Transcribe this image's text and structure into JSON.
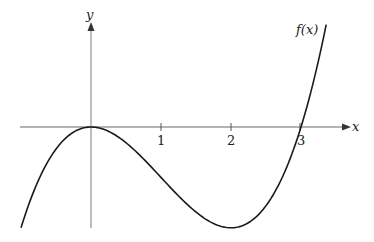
{
  "chart_data": {
    "type": "line",
    "title": "",
    "function_label": "f(x)",
    "xlabel": "x",
    "ylabel": "y",
    "x_ticks": [
      "1",
      "2",
      "3"
    ],
    "xlim": [
      -1.0,
      3.6
    ],
    "ylim": [
      -1.45,
      1.45
    ],
    "grid": false,
    "legend": "none",
    "series": [
      {
        "name": "f(x)",
        "description": "cubic with double root at x=0 and root at x=3; local max at (0,0), local min near (2,-1.44)",
        "x": [
          -1.0,
          -0.5,
          0,
          0.5,
          1.0,
          1.5,
          2.0,
          2.5,
          3.0,
          3.36
        ],
        "values": [
          -1.44,
          -0.32,
          0,
          -0.23,
          -0.72,
          -1.22,
          -1.44,
          -1.13,
          0,
          1.46
        ]
      }
    ]
  },
  "labels": {
    "x_axis": "x",
    "y_axis": "y",
    "curve": "f(x)",
    "tick_1": "1",
    "tick_2": "2",
    "tick_3": "3"
  },
  "colors": {
    "axis": "#9a9a9a",
    "curve": "#1a1a1a",
    "text": "#222222"
  }
}
